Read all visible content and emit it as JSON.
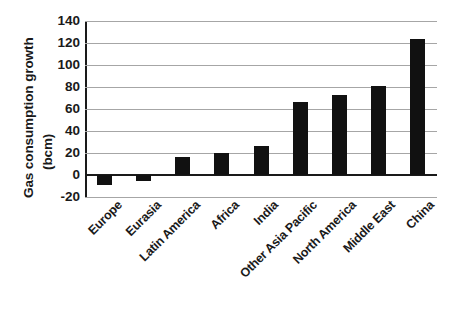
{
  "chart_data": {
    "type": "bar",
    "title": "",
    "xlabel": "",
    "ylabel": "Gas consumption growth (bcm)",
    "ylabel_lines": [
      "Gas consumption growth",
      "(bcm)"
    ],
    "categories": [
      "Europe",
      "Eurasia",
      "Latin America",
      "Africa",
      "India",
      "Other Asia Pacific",
      "North America",
      "Middle East",
      "China"
    ],
    "values": [
      -9,
      -5,
      16,
      20,
      26,
      66,
      73,
      81,
      124
    ],
    "ylim": [
      -20,
      140
    ],
    "ytick_labels": [
      "140",
      "120",
      "100",
      "80",
      "60",
      "40",
      "20",
      "0",
      "-20"
    ],
    "ytick_values": [
      140,
      120,
      100,
      80,
      60,
      40,
      20,
      0,
      -20
    ],
    "grid": true,
    "legend": "none",
    "bar_color": "#111111",
    "gridline_color": "#a6a6a6",
    "axis_color": "#1a1a1a",
    "background": "#ffffff"
  }
}
